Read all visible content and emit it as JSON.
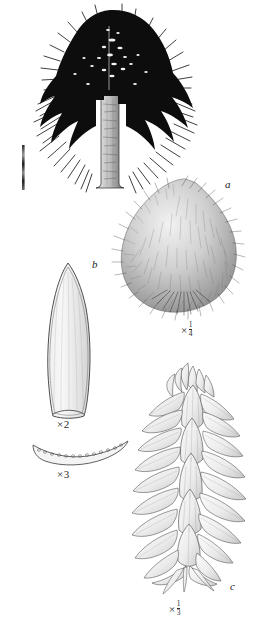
{
  "plate": {
    "background_color": "#ffffff",
    "ink_color": "#1a1a1a",
    "width": 261,
    "height": 625
  },
  "figures": [
    {
      "id": "tree-habit",
      "label": "",
      "caption": "",
      "description": "whole-tree-silhouette",
      "scale_bar": true
    },
    {
      "id": "seed-cone",
      "label": "a",
      "scale_prefix": "×",
      "scale_numerator": "1",
      "scale_denominator": "4",
      "description": "hairy-ovoid-seed-cone"
    },
    {
      "id": "leaf",
      "label": "b",
      "scale_prefix": "×",
      "scale_whole": "2",
      "description": "lanceolate-leaf-adaxial"
    },
    {
      "id": "leaf-cross-section",
      "label": "",
      "scale_prefix": "×",
      "scale_whole": "3",
      "description": "crescent-leaf-transverse-section-with-resin-canals"
    },
    {
      "id": "leafy-shoot",
      "label": "c",
      "scale_prefix": "×",
      "scale_numerator": "1",
      "scale_denominator": "3",
      "description": "imbricate-leafy-shoot"
    }
  ],
  "labels": {
    "a": "a",
    "b": "b",
    "c": "c"
  },
  "scales": {
    "cone": {
      "prefix": "×",
      "num": "1",
      "den": "4"
    },
    "leaf": {
      "prefix": "×",
      "whole": "2"
    },
    "section": {
      "prefix": "×",
      "whole": "3"
    },
    "shoot": {
      "prefix": "×",
      "num": "1",
      "den": "3"
    }
  }
}
